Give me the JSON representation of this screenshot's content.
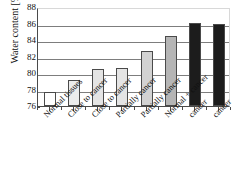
{
  "chart_data": {
    "type": "bar",
    "title": "",
    "xlabel": "",
    "ylabel": "Water content [%]",
    "ylim": [
      76,
      88
    ],
    "yticks": [
      76,
      78,
      80,
      82,
      84,
      86,
      88
    ],
    "grid": true,
    "legend": "none",
    "categories": [
      "Normal tissues",
      "Close to cancer",
      "Close to cancer",
      "Partially cancer",
      "Partially cancer",
      "Normal + cancer",
      "cancer",
      "cancer"
    ],
    "values": [
      77.7,
      79.1,
      80.45,
      80.6,
      82.65,
      84.45,
      86.05,
      85.9
    ],
    "bar_colors": [
      "#ffffff",
      "#ececec",
      "#e4e4e4",
      "#e4e4e4",
      "#d2d2d2",
      "#b5b5b5",
      "#1c1c1c",
      "#1c1c1c"
    ],
    "bar_edge_color": "#4a4a4a",
    "axis_color": "#4a4a4a",
    "grid_color": "#7d7d7d"
  }
}
